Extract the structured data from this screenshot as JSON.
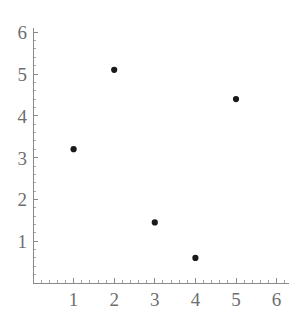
{
  "chart_data": {
    "type": "scatter",
    "title": "",
    "subtitle": "",
    "xlabel": "",
    "ylabel": "",
    "grid": false,
    "legend": false,
    "legend_position": "none",
    "point_color": "#1a1a1a",
    "axis_color": "#8a8a8a",
    "tick_label_color": "#6e6e6e",
    "background_color": "#ffffff",
    "xlim": [
      0,
      6.3
    ],
    "ylim": [
      0,
      6.1
    ],
    "x_ticks": [
      1,
      2,
      3,
      4,
      5,
      6
    ],
    "y_ticks": [
      1,
      2,
      3,
      4,
      5,
      6
    ],
    "x_tick_labels": [
      "1",
      "2",
      "3",
      "4",
      "5",
      "6"
    ],
    "y_tick_labels": [
      "1",
      "2",
      "3",
      "4",
      "5",
      "6"
    ],
    "x_minor_ticks": [
      0.2,
      0.4,
      0.6,
      0.8,
      1.2,
      1.4,
      1.6,
      1.8,
      2.2,
      2.4,
      2.6,
      2.8,
      3.2,
      3.4,
      3.6,
      3.8,
      4.2,
      4.4,
      4.6,
      4.8,
      5.2,
      5.4,
      5.6,
      5.8,
      6.2
    ],
    "y_minor_ticks": [
      0.2,
      0.4,
      0.6,
      0.8,
      1.2,
      1.4,
      1.6,
      1.8,
      2.2,
      2.4,
      2.6,
      2.8,
      3.2,
      3.4,
      3.6,
      3.8,
      4.2,
      4.4,
      4.6,
      4.8,
      5.2,
      5.4,
      5.6,
      5.8,
      6.0
    ],
    "x": [
      1,
      2,
      3,
      4,
      5
    ],
    "y": [
      3.2,
      5.1,
      1.45,
      0.6,
      4.4
    ],
    "points": [
      {
        "x": 1,
        "y": 3.2
      },
      {
        "x": 2,
        "y": 5.1
      },
      {
        "x": 3,
        "y": 1.45
      },
      {
        "x": 4,
        "y": 0.6
      },
      {
        "x": 5,
        "y": 4.4
      }
    ],
    "marker_size": 3.1
  }
}
